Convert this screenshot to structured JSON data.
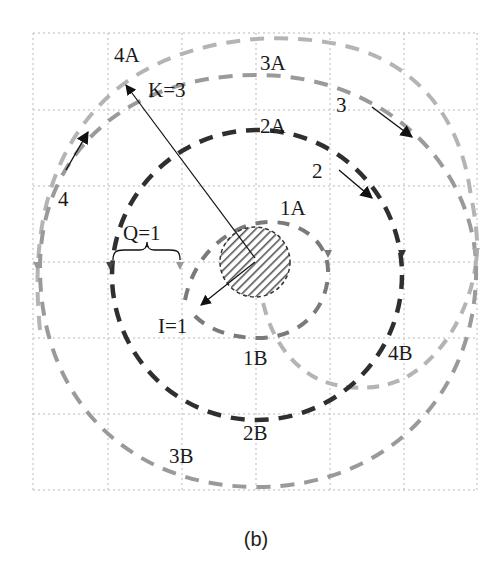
{
  "figure": {
    "caption": "(b)",
    "grid": {
      "columns": 6,
      "rows": 6,
      "style": "dotted"
    },
    "center_region": {
      "label": "",
      "fill": "hatched"
    },
    "colors": {
      "circle1": "#7a7a7a",
      "circle2": "#2f2f2f",
      "circle3": "#9a9a9a",
      "circle4": "#b4b4b4",
      "hatch": "#555555",
      "text": "#1a1a1a"
    },
    "labels": {
      "l1A": "1A",
      "l1B": "1B",
      "l2": "2",
      "l2A": "2A",
      "l2B": "2B",
      "l3": "3",
      "l3A": "3A",
      "l3B": "3B",
      "l4": "4",
      "l4A": "4A",
      "l4B": "4B",
      "K": "K=3",
      "Q": "Q=1",
      "I": "I=1"
    }
  }
}
